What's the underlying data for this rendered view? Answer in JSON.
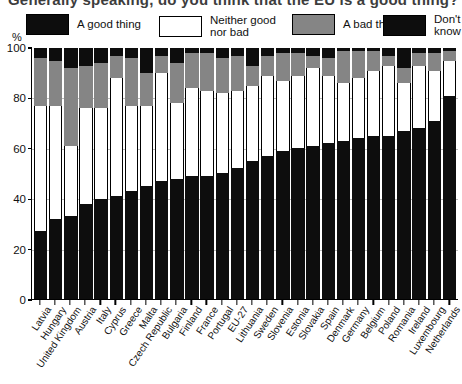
{
  "title": "Generally speaking, do you think that the EU is a good thing?",
  "axis": {
    "y_unit": "%",
    "y_ticks": [
      0,
      20,
      40,
      60,
      80,
      100
    ],
    "ylim": [
      0,
      100
    ]
  },
  "legend": [
    {
      "key": "good",
      "label": "A good thing",
      "color": "#0d0d0d",
      "swatch": "sw-black"
    },
    {
      "key": "neither",
      "label": "Neither good\nnor bad",
      "color": "#ffffff",
      "swatch": "sw-white"
    },
    {
      "key": "bad",
      "label": "A bad thing",
      "color": "#858585",
      "swatch": "sw-gray"
    },
    {
      "key": "dk",
      "label": "Don't know",
      "color": "#0d0d0d",
      "swatch": "sw-black"
    }
  ],
  "chart_data": {
    "type": "bar",
    "subtype": "stacked-100",
    "title": "Generally speaking, do you think that the EU is a good thing?",
    "xlabel": "",
    "ylabel": "%",
    "ylim": [
      0,
      100
    ],
    "yticks": [
      0,
      20,
      40,
      60,
      80,
      100
    ],
    "grid": true,
    "legend_position": "top",
    "categories": [
      "Latvia",
      "Hungary",
      "United Kingdom",
      "Austria",
      "Italy",
      "Cyprus",
      "Greece",
      "Malta",
      "Czech Republic",
      "Bulgaria",
      "Finland",
      "France",
      "Portugal",
      "EU-27",
      "Lithuania",
      "Sweden",
      "Slovenia",
      "Estonia",
      "Slovakia",
      "Spain",
      "Denmark",
      "Germany",
      "Belgium",
      "Poland",
      "Romania",
      "Ireland",
      "Luxembourg",
      "Netherlands"
    ],
    "series": [
      {
        "name": "A good thing",
        "color": "#0d0d0d",
        "values": [
          27,
          32,
          33,
          38,
          40,
          41,
          43,
          45,
          47,
          48,
          49,
          49,
          50,
          52,
          55,
          57,
          59,
          60,
          61,
          62,
          63,
          64,
          65,
          65,
          67,
          68,
          71,
          81
        ]
      },
      {
        "name": "Neither good nor bad",
        "color": "#ffffff",
        "values": [
          50,
          45,
          28,
          38,
          36,
          47,
          34,
          32,
          43,
          30,
          35,
          34,
          32,
          31,
          30,
          32,
          28,
          29,
          31,
          27,
          23,
          24,
          26,
          28,
          19,
          25,
          20,
          14
        ]
      },
      {
        "name": "A bad thing",
        "color": "#858585",
        "values": [
          19,
          18,
          31,
          17,
          18,
          9,
          19,
          13,
          7,
          16,
          14,
          15,
          14,
          14,
          8,
          8,
          11,
          9,
          5,
          7,
          13,
          11,
          8,
          4,
          6,
          5,
          7,
          4
        ]
      },
      {
        "name": "Don't know",
        "color": "#0d0d0d",
        "values": [
          4,
          5,
          8,
          7,
          6,
          3,
          4,
          10,
          3,
          6,
          2,
          2,
          4,
          3,
          7,
          3,
          2,
          2,
          3,
          4,
          1,
          1,
          1,
          3,
          8,
          2,
          2,
          1
        ]
      }
    ]
  }
}
